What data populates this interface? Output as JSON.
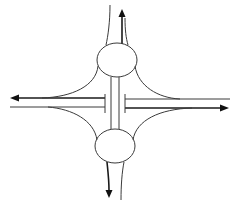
{
  "diagram": {
    "type": "dumbbell-interchange",
    "colors": {
      "line": "#3a3a3a",
      "arrow": "#111111",
      "background": "#ffffff"
    },
    "roundabouts": [
      {
        "name": "north-roundabout",
        "cx": 117,
        "cy": 60,
        "rx": 20,
        "ry": 17
      },
      {
        "name": "south-roundabout",
        "cx": 115,
        "cy": 146,
        "rx": 20,
        "ry": 17
      }
    ],
    "main_road": {
      "westbound_y": 99,
      "eastbound_y": 107,
      "directions": [
        "west",
        "east"
      ]
    },
    "exits": [
      {
        "direction": "north",
        "arrow": "up"
      },
      {
        "direction": "south",
        "arrow": "down"
      },
      {
        "direction": "west",
        "arrow": "left"
      },
      {
        "direction": "east",
        "arrow": "right"
      }
    ]
  }
}
